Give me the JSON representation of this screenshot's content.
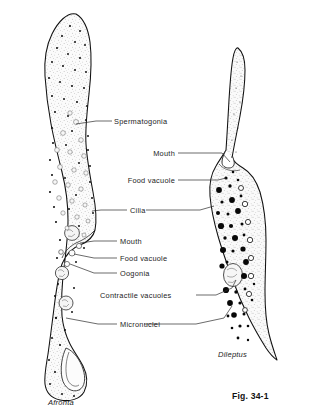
{
  "figure": {
    "caption": "Fig. 34-1",
    "background_color": "#ffffff",
    "ink_color": "#1a1a1a",
    "labels": [
      {
        "id": "spermatogonia",
        "text": "Spermatogonia",
        "align": "left",
        "x": 114,
        "y": 118,
        "leader": [
          [
            96,
            121
          ],
          [
            112,
            121
          ]
        ],
        "target": [
          76,
          123
        ]
      },
      {
        "id": "mouth-dileptus",
        "text": "Mouth",
        "align": "right",
        "x": 175,
        "y": 150,
        "leader": [
          [
            178,
            153
          ],
          [
            222,
            153
          ]
        ],
        "target": [
          222,
          157
        ]
      },
      {
        "id": "food-vacuole-dileptus",
        "text": "Food  vacuole",
        "align": "right",
        "x": 175,
        "y": 177,
        "leader": [
          [
            178,
            180
          ],
          [
            216,
            180
          ]
        ],
        "target": [
          216,
          183
        ]
      },
      {
        "id": "cilia",
        "text": "Cilia",
        "align": "left",
        "x": 130,
        "y": 207,
        "leader": [
          [
            101,
            210
          ],
          [
            127,
            210
          ]
        ],
        "target": [
          93,
          211
        ]
      },
      {
        "id": "mouth-afronta",
        "text": "Mouth",
        "align": "left",
        "x": 120,
        "y": 238,
        "leader": [
          [
            94,
            241
          ],
          [
            117,
            241
          ]
        ],
        "target": [
          78,
          242
        ]
      },
      {
        "id": "food-vacuole-afronta",
        "text": "Food  vacuole",
        "align": "left",
        "x": 120,
        "y": 255,
        "leader": [
          [
            94,
            258
          ],
          [
            117,
            258
          ]
        ],
        "target": [
          72,
          256
        ]
      },
      {
        "id": "oogonia",
        "text": "Oogonia",
        "align": "left",
        "x": 120,
        "y": 270,
        "leader": [
          [
            94,
            273
          ],
          [
            117,
            273
          ]
        ],
        "target": [
          68,
          265
        ]
      },
      {
        "id": "contractile-vacuoles",
        "text": "Contractile  vacuoles",
        "align": "left",
        "x": 100,
        "y": 292,
        "leader": [
          [
            196,
            295
          ],
          [
            214,
            295
          ]
        ],
        "target": [
          226,
          288
        ]
      },
      {
        "id": "micronuclei",
        "text": "Micronuclei",
        "align": "left",
        "x": 120,
        "y": 321,
        "leader": [
          [
            98,
            324
          ],
          [
            117,
            324
          ]
        ],
        "target": [
          65,
          319
        ]
      }
    ],
    "organisms": [
      {
        "id": "afronta",
        "name": "Afronta",
        "name_x": 48,
        "name_y": 399
      },
      {
        "id": "dileptus",
        "name": "Dileptus",
        "name_x": 218,
        "name_y": 351
      }
    ],
    "caption_x": 232,
    "caption_y": 392
  }
}
